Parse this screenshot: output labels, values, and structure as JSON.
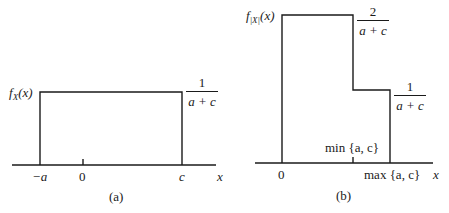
{
  "figure": {
    "panel_a": {
      "caption": "(a)",
      "y_label_func": "f",
      "y_label_sub": "X",
      "y_label_arg": "(x)",
      "height_label": {
        "numerator": "1",
        "denominator": "a + c"
      },
      "x_ticks": [
        "−a",
        "0",
        "c"
      ],
      "x_axis_label": "x",
      "shape": "uniform density on [−a, c] with height 1/(a+c)"
    },
    "panel_b": {
      "caption": "(b)",
      "y_label_func": "f",
      "y_label_sub": "|X|",
      "y_label_arg": "(x)",
      "high_label": {
        "numerator": "2",
        "denominator": "a + c"
      },
      "low_label": {
        "numerator": "1",
        "denominator": "a + c"
      },
      "x_ticks": [
        "0",
        "min {a, c}",
        "max {a, c}"
      ],
      "x_axis_label": "x",
      "shape": "step density: 2/(a+c) on [0, min{a,c}], 1/(a+c) on [min{a,c}, max{a,c}]"
    },
    "line_color": "#1a1a1a"
  }
}
